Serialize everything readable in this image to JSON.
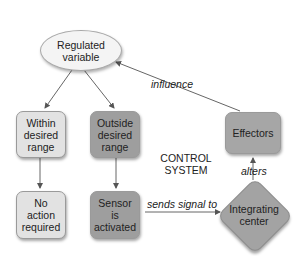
{
  "diagram": {
    "nodes": {
      "regulated_variable": {
        "label": "Regulated variable",
        "line1": "Regulated",
        "line2": "variable",
        "shape": "ellipse"
      },
      "within_range": {
        "label": "Within desired range",
        "line1": "Within",
        "line2": "desired",
        "line3": "range",
        "shape": "rounded-rect"
      },
      "outside_range": {
        "label": "Outside desired range",
        "line1": "Outside",
        "line2": "desired",
        "line3": "range",
        "shape": "rounded-rect"
      },
      "no_action": {
        "label": "No action required",
        "line1": "No",
        "line2": "action",
        "line3": "required",
        "shape": "rounded-rect"
      },
      "sensor": {
        "label": "Sensor is activated",
        "line1": "Sensor",
        "line2": "is",
        "line3": "activated",
        "shape": "rounded-rect"
      },
      "integrating_center": {
        "label": "Integrating center",
        "line1": "Integrating",
        "line2": "center",
        "shape": "diamond"
      },
      "effectors": {
        "label": "Effectors",
        "shape": "rounded-rect"
      }
    },
    "group_label": {
      "line1": "CONTROL",
      "line2": "SYSTEM"
    },
    "edges": [
      {
        "from": "regulated_variable",
        "to": "within_range",
        "label": ""
      },
      {
        "from": "regulated_variable",
        "to": "outside_range",
        "label": ""
      },
      {
        "from": "within_range",
        "to": "no_action",
        "label": ""
      },
      {
        "from": "outside_range",
        "to": "sensor",
        "label": ""
      },
      {
        "from": "sensor",
        "to": "integrating_center",
        "label": "sends signal to"
      },
      {
        "from": "integrating_center",
        "to": "effectors",
        "label": "alters"
      },
      {
        "from": "effectors",
        "to": "regulated_variable",
        "label": "influence"
      }
    ],
    "edge_labels": {
      "sends_signal_to": "sends signal to",
      "alters": "alters",
      "influence": "influence"
    },
    "colors": {
      "light_node": "#e2e2e2",
      "dark_node": "#9e9e9e",
      "ellipse_fill": "#f4f4f4",
      "arrow": "#555555"
    }
  }
}
